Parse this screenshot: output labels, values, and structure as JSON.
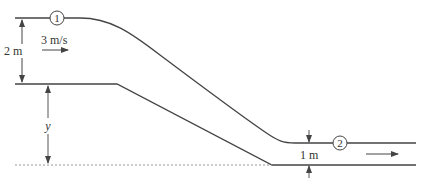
{
  "diagram": {
    "type": "open-channel-flow-over-drop",
    "labels": {
      "station1": "1",
      "station2": "2",
      "depth1": "2 m",
      "velocity1": "3 m/s",
      "height_y": "y",
      "depth2": "1 m"
    },
    "colors": {
      "line": "#444444",
      "datum": "#999999",
      "text": "#333333",
      "background": "#ffffff"
    }
  }
}
